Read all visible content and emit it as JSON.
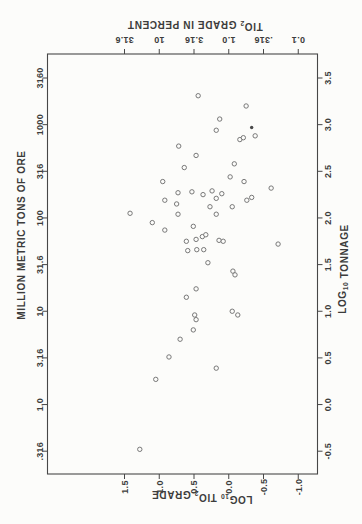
{
  "figure": {
    "background": "#fcfcfa",
    "ink_color": "#3c3c3c",
    "axis_line_color": "#474747",
    "point_stroke_color": "#787878",
    "filled_point_color": "#4a4a4a"
  },
  "chart_data": {
    "type": "scatter",
    "title": "",
    "xlabel": "LOG10 TONNAGE",
    "x2label": "MILLION METRIC TONS OF ORE",
    "ylabel": "LOG10 TIO2 GRADE",
    "y2label": "TIO2 GRADE IN PERCENT",
    "xlim": [
      -0.75,
      3.76
    ],
    "ylim": [
      -1.28,
      2.61
    ],
    "grid": false,
    "legend": "none",
    "orientation": "landscape chart rotated 90deg CCW onto portrait page",
    "titles": {
      "tonnage_log": [
        {
          "text": "LOG"
        },
        {
          "text": "10",
          "sub": true
        },
        {
          "text": " TONNAGE"
        }
      ],
      "tonnage_units": [
        {
          "text": "MILLION METRIC TONS OF ORE"
        }
      ],
      "grade_log": [
        {
          "text": "LOG"
        },
        {
          "text": "10",
          "sub": true
        },
        {
          "text": " TIO"
        },
        {
          "text": "2",
          "sub": true
        },
        {
          "text": " GRADE"
        }
      ],
      "grade_percent": [
        {
          "text": "TIO"
        },
        {
          "text": "2",
          "sub": true
        },
        {
          "text": " GRADE IN PERCENT"
        }
      ]
    },
    "tonnage_axis": {
      "log_ticks": [
        {
          "v": 3.5,
          "label": "3.5"
        },
        {
          "v": 3.0,
          "label": "3.0"
        },
        {
          "v": 2.5,
          "label": "2.5"
        },
        {
          "v": 2.0,
          "label": "2.0"
        },
        {
          "v": 1.5,
          "label": "1.5"
        },
        {
          "v": 1.0,
          "label": "1.0"
        },
        {
          "v": 0.5,
          "label": "0.5"
        },
        {
          "v": 0.0,
          "label": "0.0"
        },
        {
          "v": -0.5,
          "label": "-0.5"
        }
      ],
      "unit_ticks": [
        {
          "v": 3.5,
          "label": "3160"
        },
        {
          "v": 3.0,
          "label": "1000"
        },
        {
          "v": 2.5,
          "label": "316"
        },
        {
          "v": 2.0,
          "label": "100"
        },
        {
          "v": 1.5,
          "label": "31.6"
        },
        {
          "v": 1.0,
          "label": "10"
        },
        {
          "v": 0.5,
          "label": "3.16"
        },
        {
          "v": 0.0,
          "label": "1.0"
        },
        {
          "v": -0.5,
          "label": ".316"
        }
      ]
    },
    "grade_axis": {
      "log_ticks": [
        {
          "v": 1.5,
          "label": "1.5"
        },
        {
          "v": 1.0,
          "label": "1.0"
        },
        {
          "v": 0.5,
          "label": "0.5"
        },
        {
          "v": 0.0,
          "label": "0.0"
        },
        {
          "v": -0.5,
          "label": "-0.5"
        },
        {
          "v": -1.0,
          "label": "-1.0"
        }
      ],
      "percent_ticks": [
        {
          "v": 1.5,
          "label": "31.6"
        },
        {
          "v": 1.0,
          "label": "10"
        },
        {
          "v": 0.5,
          "label": "3.16"
        },
        {
          "v": 0.0,
          "label": "1.0"
        },
        {
          "v": -0.5,
          "label": ".316"
        },
        {
          "v": -1.0,
          "label": "0.1"
        }
      ]
    },
    "points_format": "[log10_tonnage, log10_TiO2_grade]",
    "points": [
      [
        2.77,
        0.72
      ],
      [
        2.39,
        0.95
      ],
      [
        2.27,
        0.73
      ],
      [
        3.31,
        0.44
      ],
      [
        3.2,
        -0.25
      ],
      [
        3.06,
        0.13
      ],
      [
        2.94,
        0.18
      ],
      [
        2.97,
        -0.33
      ],
      [
        2.84,
        -0.16
      ],
      [
        2.86,
        -0.21
      ],
      [
        2.88,
        -0.38
      ],
      [
        2.67,
        0.47
      ],
      [
        2.54,
        0.64
      ],
      [
        2.58,
        -0.08
      ],
      [
        2.44,
        -0.02
      ],
      [
        2.39,
        -0.22
      ],
      [
        2.32,
        -0.61
      ],
      [
        2.19,
        -0.26
      ],
      [
        2.22,
        -0.33
      ],
      [
        2.28,
        0.53
      ],
      [
        2.25,
        0.37
      ],
      [
        2.29,
        0.24
      ],
      [
        2.21,
        0.18
      ],
      [
        2.26,
        0.1
      ],
      [
        2.12,
        0.27
      ],
      [
        2.04,
        0.18
      ],
      [
        2.12,
        -0.05
      ],
      [
        1.91,
        0.51
      ],
      [
        1.77,
        0.47
      ],
      [
        1.8,
        0.38
      ],
      [
        1.82,
        0.33
      ],
      [
        1.76,
        0.14
      ],
      [
        1.75,
        0.08
      ],
      [
        1.75,
        0.61
      ],
      [
        1.65,
        0.59
      ],
      [
        1.66,
        0.46
      ],
      [
        1.66,
        0.36
      ],
      [
        2.19,
        0.92
      ],
      [
        2.15,
        0.75
      ],
      [
        2.05,
        1.42
      ],
      [
        2.04,
        0.73
      ],
      [
        1.95,
        1.1
      ],
      [
        1.87,
        0.92
      ],
      [
        1.52,
        0.3
      ],
      [
        1.43,
        -0.06
      ],
      [
        1.39,
        -0.09
      ],
      [
        1.72,
        -0.71
      ],
      [
        1.24,
        0.47
      ],
      [
        1.15,
        0.61
      ],
      [
        1.0,
        -0.05
      ],
      [
        0.96,
        -0.13
      ],
      [
        0.96,
        0.49
      ],
      [
        0.91,
        0.47
      ],
      [
        0.8,
        0.51
      ],
      [
        0.7,
        0.7
      ],
      [
        0.51,
        0.86
      ],
      [
        0.27,
        1.05
      ],
      [
        0.39,
        0.18
      ],
      [
        -0.48,
        1.28
      ]
    ],
    "filled_point_index": 7
  }
}
